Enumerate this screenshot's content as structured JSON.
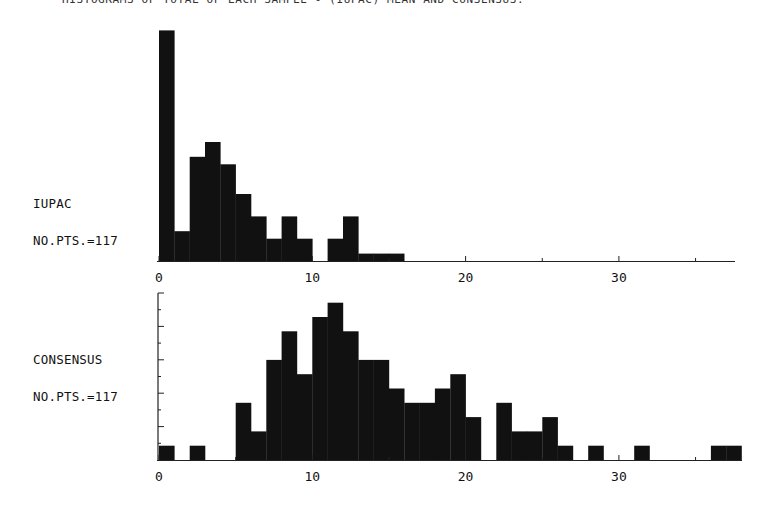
{
  "title": "HISTOGRAMS OF TOTAL OF EACH SAMPLE - (IUPAC) MEAN AND CONSENSUS.",
  "colors": {
    "bar": "#111111",
    "axis": "#222222",
    "background": "#ffffff"
  },
  "chart_data": [
    {
      "type": "bar",
      "title": "IUPAC",
      "n_label": "NO.PTS.=117",
      "bin_width": 1,
      "categories": [
        0,
        1,
        2,
        3,
        4,
        5,
        6,
        7,
        8,
        9,
        10,
        11,
        12,
        13,
        14,
        15,
        16,
        17,
        18,
        19,
        20,
        21,
        22,
        23,
        24,
        25,
        26,
        27,
        28,
        29,
        30,
        31,
        32,
        33,
        34,
        35,
        36,
        37
      ],
      "values": [
        31,
        4,
        14,
        16,
        13,
        9,
        6,
        3,
        6,
        3,
        0,
        3,
        6,
        1,
        1,
        1,
        0,
        0,
        0,
        0,
        0,
        0,
        0,
        0,
        0,
        0,
        0,
        0,
        0,
        0,
        0,
        0,
        0,
        0,
        0,
        0,
        0,
        0
      ],
      "xlabel": "",
      "ylabel": "",
      "xlim": [
        0,
        37.5
      ],
      "xticks_major": [
        0,
        10,
        20,
        30
      ],
      "xticks_minor": [
        5,
        15,
        25,
        35
      ],
      "xtick_labels": [
        "0",
        "10",
        "20",
        "30"
      ],
      "ylim": [
        0,
        31
      ],
      "grid": false,
      "legend": "none"
    },
    {
      "type": "bar",
      "title": "CONSENSUS",
      "n_label": "NO.PTS.=117",
      "bin_width": 1,
      "categories": [
        0,
        1,
        2,
        3,
        4,
        5,
        6,
        7,
        8,
        9,
        10,
        11,
        12,
        13,
        14,
        15,
        16,
        17,
        18,
        19,
        20,
        21,
        22,
        23,
        24,
        25,
        26,
        27,
        28,
        29,
        30,
        31,
        32,
        33,
        34,
        35,
        36,
        37
      ],
      "values": [
        1,
        0,
        1,
        0,
        0,
        4,
        2,
        7,
        9,
        6,
        10,
        11,
        9,
        7,
        7,
        5,
        4,
        4,
        5,
        6,
        3,
        0,
        4,
        2,
        2,
        3,
        1,
        0,
        1,
        0,
        0,
        1,
        0,
        0,
        0,
        0,
        1,
        1
      ],
      "xlabel": "",
      "ylabel": "",
      "xlim": [
        0,
        38
      ],
      "xticks_major": [
        0,
        10,
        20,
        30
      ],
      "xticks_minor": [
        5,
        15,
        25,
        35
      ],
      "xtick_labels": [
        "0",
        "10",
        "20",
        "30"
      ],
      "ylim": [
        0,
        11.7
      ],
      "y_ticks_count": 10,
      "grid": false,
      "legend": "none"
    }
  ]
}
